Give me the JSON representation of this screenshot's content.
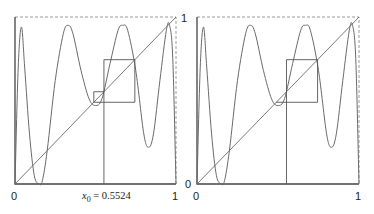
{
  "colors": {
    "curve": "#6a6a6a",
    "diagonal": "#6a6a6a",
    "cobweb": "#555555",
    "axis": "#444444",
    "frame_dashed": "#9a9a9a",
    "text": "#222222"
  },
  "panels": [
    {
      "id": "left",
      "origin_px": [
        15,
        184
      ],
      "top_right_px": [
        176,
        17
      ],
      "tick_labels": {
        "x_min": "0",
        "x_max": "1",
        "y_max": "1",
        "y_min": ""
      },
      "annotation": {
        "text_var": "x",
        "text_sub": "0",
        "text_rest": " = 0.5524"
      },
      "x0": 0.5524,
      "cobweb_box": {
        "x_left": 0.5524,
        "x_right": 0.7444,
        "y_bottom": 0.4894,
        "y_top": 0.7444
      },
      "small_step": {
        "x": 0.4894,
        "y_from": 0.4894,
        "y_to": 0.5524
      }
    },
    {
      "id": "right",
      "origin_px": [
        197,
        184
      ],
      "top_right_px": [
        359,
        17
      ],
      "tick_labels": {
        "x_min": "0",
        "x_max": "1",
        "y_max": "",
        "y_min": "0"
      },
      "x0": 0.5524,
      "cobweb_box": {
        "x_left": 0.5524,
        "x_right": 0.7444,
        "y_bottom": 0.4894,
        "y_top": 0.7444
      },
      "small_step": null
    }
  ],
  "chart_data": {
    "type": "line",
    "title": "",
    "xlabel": "",
    "ylabel": "",
    "xlim": [
      0,
      1
    ],
    "ylim": [
      0,
      1
    ],
    "x_ticks": [
      "0",
      "1"
    ],
    "y_ticks": [
      "0",
      "1"
    ],
    "annotation": "x0 = 0.5524",
    "series": [
      {
        "name": "f(x)",
        "shape": "4 humps: peaks near y≈0.95 at x≈0.04, 0.33, 0.67, 0.96; minima near y≈0 at edges and ~0.2 at x≈0.17/0.83, ~0.48 at x≈0.5"
      },
      {
        "name": "y = x",
        "x": [
          0,
          1
        ],
        "y": [
          0,
          1
        ]
      },
      {
        "name": "cobweb",
        "points": [
          [
            0.5524,
            0
          ],
          [
            0.5524,
            0.7444
          ],
          [
            0.7444,
            0.7444
          ],
          [
            0.7444,
            0.4894
          ],
          [
            0.4894,
            0.4894
          ],
          [
            0.4894,
            0.5524
          ],
          [
            0.5524,
            0.5524
          ]
        ]
      }
    ],
    "grid": false,
    "legend": "none"
  }
}
